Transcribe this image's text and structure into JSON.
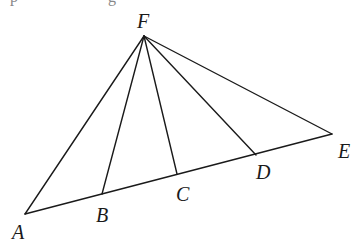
{
  "diagram": {
    "type": "geometry-figure",
    "stroke_color": "#1a1a1a",
    "background": "#ffffff",
    "points": {
      "F": {
        "label": "F",
        "x": 144,
        "y": 36
      },
      "A": {
        "label": "A",
        "x": 25,
        "y": 214
      },
      "B": {
        "label": "B",
        "x": 102,
        "y": 194
      },
      "C": {
        "label": "C",
        "x": 177,
        "y": 174
      },
      "D": {
        "label": "D",
        "x": 256,
        "y": 155
      },
      "E": {
        "label": "E",
        "x": 332,
        "y": 134
      }
    },
    "segments": [
      {
        "from": "A",
        "to": "E",
        "role": "base-line"
      },
      {
        "from": "F",
        "to": "A",
        "role": "side"
      },
      {
        "from": "F",
        "to": "B",
        "role": "cevian"
      },
      {
        "from": "F",
        "to": "C",
        "role": "cevian"
      },
      {
        "from": "F",
        "to": "D",
        "role": "cevian"
      },
      {
        "from": "F",
        "to": "E",
        "role": "side"
      }
    ],
    "labels": [
      "F",
      "A",
      "B",
      "C",
      "D",
      "E"
    ]
  }
}
